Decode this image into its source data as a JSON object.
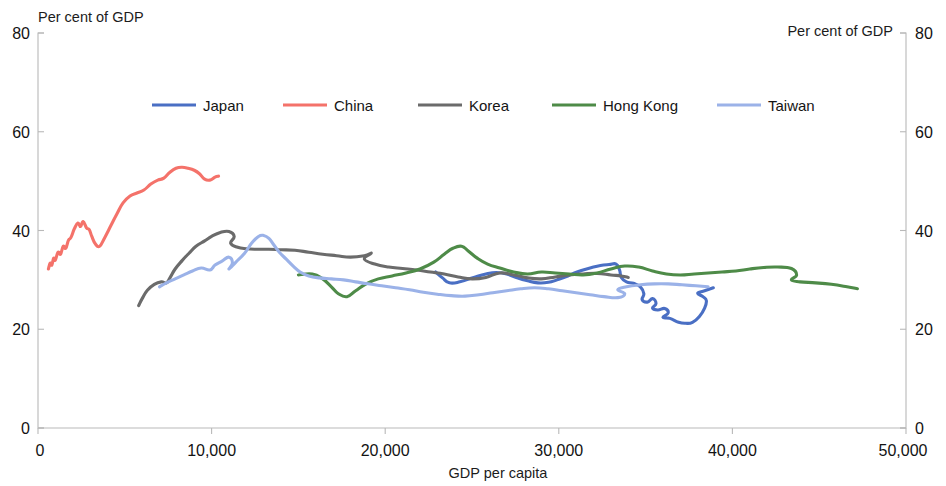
{
  "chart_data": {
    "type": "line",
    "title": "",
    "xlabel": "GDP per capita",
    "ylabel_left": "Per cent of GDP",
    "ylabel_right": "Per cent of GDP",
    "xlim": [
      0,
      50000
    ],
    "ylim": [
      0,
      80
    ],
    "x_ticks": [
      0,
      10000,
      20000,
      30000,
      40000,
      50000
    ],
    "x_tick_labels": [
      "0",
      "10,000",
      "20,000",
      "30,000",
      "40,000",
      "50,000"
    ],
    "y_ticks": [
      0,
      20,
      40,
      60,
      80
    ],
    "y_tick_labels": [
      "0",
      "20",
      "40",
      "60",
      "80"
    ],
    "y_ticks_right": [
      0,
      20,
      40,
      60,
      80
    ],
    "y_tick_labels_right": [
      "0",
      "20",
      "40",
      "60",
      "80"
    ],
    "grid": false,
    "legend_position": "top-center",
    "series": [
      {
        "name": "Japan",
        "color": "#4a6fc4",
        "points": [
          [
            22900,
            31.6
          ],
          [
            23300,
            30.4
          ],
          [
            23700,
            29.4
          ],
          [
            24300,
            29.6
          ],
          [
            25100,
            30.5
          ],
          [
            25800,
            31.2
          ],
          [
            26400,
            31.5
          ],
          [
            27000,
            31.2
          ],
          [
            27600,
            30.4
          ],
          [
            28200,
            29.8
          ],
          [
            28800,
            29.4
          ],
          [
            29400,
            29.5
          ],
          [
            29900,
            30.0
          ],
          [
            30400,
            30.6
          ],
          [
            30900,
            31.4
          ],
          [
            31400,
            32.0
          ],
          [
            31900,
            32.5
          ],
          [
            32400,
            32.9
          ],
          [
            32900,
            33.1
          ],
          [
            33300,
            33.2
          ],
          [
            33500,
            32.0
          ],
          [
            33600,
            30.5
          ],
          [
            33900,
            29.6
          ],
          [
            34300,
            29.3
          ],
          [
            34700,
            28.6
          ],
          [
            34900,
            27.2
          ],
          [
            34800,
            26.0
          ],
          [
            35100,
            25.5
          ],
          [
            35400,
            26.2
          ],
          [
            35600,
            25.2
          ],
          [
            35400,
            24.3
          ],
          [
            35700,
            23.9
          ],
          [
            36100,
            24.2
          ],
          [
            36300,
            23.3
          ],
          [
            36000,
            22.4
          ],
          [
            36400,
            22.2
          ],
          [
            36900,
            21.4
          ],
          [
            37300,
            21.2
          ],
          [
            37700,
            21.4
          ],
          [
            38100,
            22.6
          ],
          [
            38400,
            24.3
          ],
          [
            38500,
            25.8
          ],
          [
            38300,
            26.6
          ],
          [
            38000,
            27.3
          ],
          [
            38400,
            27.8
          ],
          [
            38900,
            28.4
          ]
        ]
      },
      {
        "name": "China",
        "color": "#f4726a",
        "points": [
          [
            600,
            32.2
          ],
          [
            700,
            33.4
          ],
          [
            800,
            33.0
          ],
          [
            900,
            34.4
          ],
          [
            1000,
            34.0
          ],
          [
            1150,
            35.6
          ],
          [
            1300,
            35.2
          ],
          [
            1450,
            36.8
          ],
          [
            1600,
            36.4
          ],
          [
            1750,
            38.0
          ],
          [
            1900,
            38.6
          ],
          [
            2100,
            40.4
          ],
          [
            2300,
            41.5
          ],
          [
            2450,
            40.8
          ],
          [
            2600,
            41.8
          ],
          [
            2800,
            40.5
          ],
          [
            2950,
            40.2
          ],
          [
            3100,
            38.8
          ],
          [
            3300,
            37.3
          ],
          [
            3550,
            36.8
          ],
          [
            3850,
            38.6
          ],
          [
            4200,
            41.0
          ],
          [
            4550,
            43.4
          ],
          [
            4900,
            45.6
          ],
          [
            5300,
            47.0
          ],
          [
            5700,
            47.6
          ],
          [
            6100,
            48.2
          ],
          [
            6500,
            49.4
          ],
          [
            6900,
            50.2
          ],
          [
            7250,
            50.6
          ],
          [
            7600,
            51.8
          ],
          [
            7950,
            52.6
          ],
          [
            8300,
            52.8
          ],
          [
            8650,
            52.6
          ],
          [
            9000,
            52.2
          ],
          [
            9300,
            51.5
          ],
          [
            9600,
            50.4
          ],
          [
            9900,
            50.2
          ],
          [
            10200,
            50.8
          ],
          [
            10400,
            51.0
          ]
        ]
      },
      {
        "name": "Korea",
        "color": "#6b6b6b",
        "points": [
          [
            5800,
            24.8
          ],
          [
            6000,
            26.2
          ],
          [
            6300,
            27.9
          ],
          [
            6700,
            29.1
          ],
          [
            7100,
            29.6
          ],
          [
            7400,
            29.4
          ],
          [
            7600,
            30.4
          ],
          [
            7900,
            32.2
          ],
          [
            8300,
            33.9
          ],
          [
            8700,
            35.4
          ],
          [
            9100,
            36.8
          ],
          [
            9600,
            37.9
          ],
          [
            10000,
            38.8
          ],
          [
            10500,
            39.6
          ],
          [
            11000,
            39.8
          ],
          [
            11300,
            38.8
          ],
          [
            11100,
            37.4
          ],
          [
            11500,
            36.6
          ],
          [
            12000,
            36.3
          ],
          [
            12600,
            36.2
          ],
          [
            13300,
            36.2
          ],
          [
            14000,
            36.1
          ],
          [
            14800,
            36.0
          ],
          [
            15600,
            35.6
          ],
          [
            16400,
            35.2
          ],
          [
            17200,
            34.9
          ],
          [
            18000,
            34.6
          ],
          [
            18800,
            34.9
          ],
          [
            19200,
            35.4
          ],
          [
            18800,
            34.2
          ],
          [
            19400,
            33.2
          ],
          [
            20200,
            32.6
          ],
          [
            21000,
            32.3
          ],
          [
            21800,
            32.0
          ],
          [
            22600,
            31.6
          ],
          [
            23400,
            31.2
          ],
          [
            24200,
            30.6
          ],
          [
            25000,
            30.2
          ],
          [
            25800,
            30.5
          ],
          [
            26600,
            31.4
          ],
          [
            27400,
            31.0
          ],
          [
            28200,
            30.4
          ],
          [
            29000,
            30.2
          ],
          [
            29800,
            30.6
          ],
          [
            30600,
            31.0
          ],
          [
            31400,
            31.2
          ],
          [
            32200,
            31.3
          ],
          [
            33000,
            31.0
          ],
          [
            33600,
            30.8
          ],
          [
            34000,
            30.5
          ]
        ]
      },
      {
        "name": "Hong Kong",
        "color": "#4e8b48",
        "points": [
          [
            15000,
            31.0
          ],
          [
            15800,
            31.2
          ],
          [
            16400,
            30.2
          ],
          [
            16900,
            28.6
          ],
          [
            17300,
            27.2
          ],
          [
            17800,
            26.6
          ],
          [
            18300,
            27.8
          ],
          [
            18900,
            29.2
          ],
          [
            19600,
            30.2
          ],
          [
            20400,
            30.8
          ],
          [
            21200,
            31.4
          ],
          [
            22000,
            32.2
          ],
          [
            22800,
            33.6
          ],
          [
            23400,
            35.2
          ],
          [
            23900,
            36.4
          ],
          [
            24400,
            36.8
          ],
          [
            24800,
            35.8
          ],
          [
            25300,
            34.4
          ],
          [
            25900,
            33.2
          ],
          [
            26600,
            32.4
          ],
          [
            27400,
            31.6
          ],
          [
            28200,
            31.2
          ],
          [
            29000,
            31.6
          ],
          [
            29800,
            31.4
          ],
          [
            30600,
            31.2
          ],
          [
            31400,
            31.0
          ],
          [
            32200,
            31.4
          ],
          [
            33000,
            32.2
          ],
          [
            33800,
            32.8
          ],
          [
            34600,
            32.6
          ],
          [
            35400,
            31.8
          ],
          [
            36200,
            31.2
          ],
          [
            37000,
            31.0
          ],
          [
            37800,
            31.2
          ],
          [
            38600,
            31.4
          ],
          [
            39400,
            31.6
          ],
          [
            40200,
            31.8
          ],
          [
            41000,
            32.2
          ],
          [
            41800,
            32.5
          ],
          [
            42600,
            32.6
          ],
          [
            43400,
            32.3
          ],
          [
            43700,
            31.0
          ],
          [
            43400,
            30.0
          ],
          [
            43900,
            29.6
          ],
          [
            44800,
            29.4
          ],
          [
            45700,
            29.1
          ],
          [
            46600,
            28.6
          ],
          [
            47200,
            28.2
          ]
        ]
      },
      {
        "name": "Taiwan",
        "color": "#9bb2e8",
        "points": [
          [
            7000,
            28.6
          ],
          [
            7400,
            29.4
          ],
          [
            7900,
            30.2
          ],
          [
            8400,
            31.0
          ],
          [
            8900,
            31.8
          ],
          [
            9400,
            32.4
          ],
          [
            9900,
            32.0
          ],
          [
            10200,
            33.0
          ],
          [
            10600,
            33.8
          ],
          [
            11000,
            34.6
          ],
          [
            11200,
            33.4
          ],
          [
            11000,
            32.2
          ],
          [
            11400,
            33.6
          ],
          [
            11900,
            35.4
          ],
          [
            12300,
            37.4
          ],
          [
            12700,
            38.8
          ],
          [
            13000,
            39.0
          ],
          [
            13300,
            38.4
          ],
          [
            13600,
            37.0
          ],
          [
            13900,
            35.6
          ],
          [
            14300,
            34.2
          ],
          [
            14700,
            32.8
          ],
          [
            15100,
            31.6
          ],
          [
            15600,
            30.8
          ],
          [
            16200,
            30.4
          ],
          [
            16900,
            30.2
          ],
          [
            17600,
            30.0
          ],
          [
            18300,
            29.6
          ],
          [
            19000,
            29.2
          ],
          [
            19800,
            28.8
          ],
          [
            20600,
            28.4
          ],
          [
            21400,
            28.0
          ],
          [
            22200,
            27.5
          ],
          [
            23000,
            27.1
          ],
          [
            23800,
            26.8
          ],
          [
            24600,
            26.7
          ],
          [
            25400,
            27.0
          ],
          [
            26200,
            27.4
          ],
          [
            27000,
            27.8
          ],
          [
            27800,
            28.2
          ],
          [
            28600,
            28.4
          ],
          [
            29400,
            28.2
          ],
          [
            30200,
            27.8
          ],
          [
            31000,
            27.4
          ],
          [
            31800,
            27.0
          ],
          [
            32600,
            26.6
          ],
          [
            33400,
            26.4
          ],
          [
            33800,
            27.2
          ],
          [
            33400,
            28.0
          ],
          [
            33900,
            28.6
          ],
          [
            34700,
            29.0
          ],
          [
            35500,
            29.2
          ],
          [
            36300,
            29.2
          ],
          [
            37100,
            29.0
          ],
          [
            37900,
            28.8
          ],
          [
            38600,
            28.6
          ]
        ]
      }
    ]
  },
  "axes": {
    "left_header": "Per cent of GDP",
    "right_header": "Per cent of GDP",
    "x_title": "GDP per capita"
  },
  "legend": {
    "items": [
      {
        "label": "Japan",
        "color": "#4a6fc4"
      },
      {
        "label": "China",
        "color": "#f4726a"
      },
      {
        "label": "Korea",
        "color": "#6b6b6b"
      },
      {
        "label": "Hong Kong",
        "color": "#4e8b48"
      },
      {
        "label": "Taiwan",
        "color": "#9bb2e8"
      }
    ]
  },
  "ticks": {
    "x": [
      "0",
      "10,000",
      "20,000",
      "30,000",
      "40,000",
      "50,000"
    ],
    "y_left": [
      "0",
      "20",
      "40",
      "60",
      "80"
    ],
    "y_right": [
      "0",
      "20",
      "40",
      "60",
      "80"
    ]
  }
}
